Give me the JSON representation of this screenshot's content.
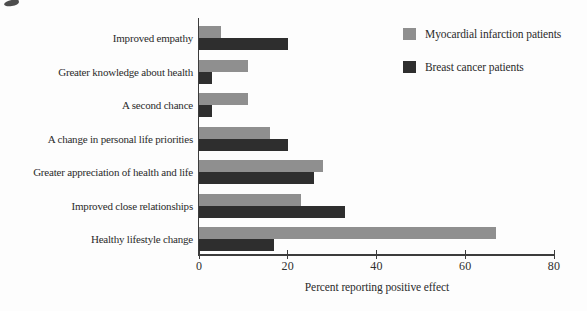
{
  "chart_data": {
    "type": "bar",
    "orientation": "horizontal",
    "title": "",
    "xlabel": "Percent reporting positive effect",
    "ylabel": "",
    "xlim": [
      0,
      80
    ],
    "xticks": [
      0,
      20,
      40,
      60,
      80
    ],
    "grid": false,
    "legend_position": "top-right",
    "categories": [
      "Improved empathy",
      "Greater knowledge about health",
      "A second chance",
      "A change in personal life priorities",
      "Greater appreciation of health and life",
      "Improved close relationships",
      "Healthy lifestyle change"
    ],
    "series": [
      {
        "name": "Myocardial infarction patients",
        "color": "#8f8f8f",
        "values": [
          5,
          11,
          11,
          16,
          28,
          23,
          67
        ]
      },
      {
        "name": "Breast cancer patients",
        "color": "#2e2e2e",
        "values": [
          20,
          3,
          3,
          20,
          26,
          33,
          17
        ]
      }
    ]
  },
  "axis_colors": {
    "line": "#3c3c3c",
    "text": "#2b2b2b"
  }
}
